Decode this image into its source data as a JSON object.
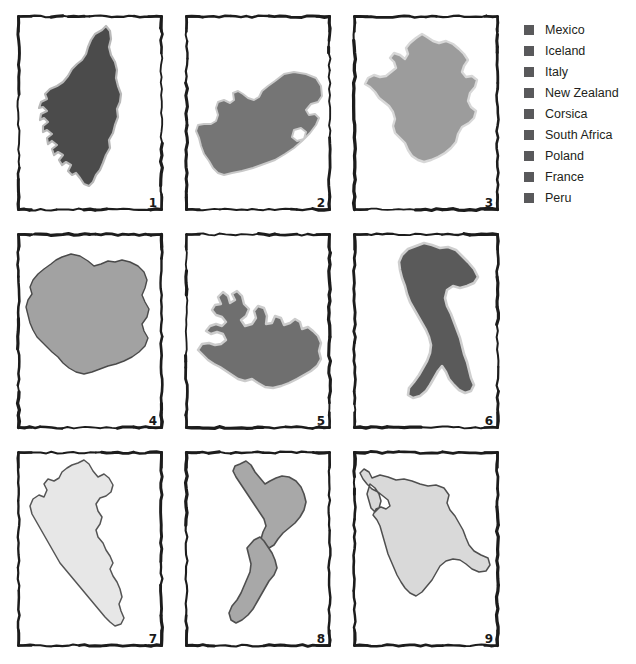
{
  "figure": {
    "type": "country-shape-quiz-grid",
    "background_color": "#ffffff",
    "rows": 3,
    "columns": 3
  },
  "legend": {
    "position": "right",
    "swatch_color": "#59595b",
    "items": [
      {
        "label": "Mexico",
        "swatch": "#59595b"
      },
      {
        "label": "Iceland",
        "swatch": "#59595b"
      },
      {
        "label": "Italy",
        "swatch": "#59595b"
      },
      {
        "label": "New Zealand",
        "swatch": "#59595b"
      },
      {
        "label": "Corsica",
        "swatch": "#59595b"
      },
      {
        "label": "South Africa",
        "swatch": "#59595b"
      },
      {
        "label": "Poland",
        "swatch": "#59595b"
      },
      {
        "label": "France",
        "swatch": "#59595b"
      },
      {
        "label": "Peru",
        "swatch": "#59595b"
      }
    ]
  },
  "panels": [
    {
      "number": "1",
      "shape": "corsica",
      "fill": "#4b4b4b",
      "stroke": "#b9b9b9",
      "stroke_width": 2.2,
      "frame_color": "#1c1c1c"
    },
    {
      "number": "2",
      "shape": "south-africa",
      "fill": "#757575",
      "stroke": "#c9c9c9",
      "stroke_width": 2.0,
      "frame_color": "#1c1c1c"
    },
    {
      "number": "3",
      "shape": "france",
      "fill": "#9c9c9c",
      "stroke": "#d8d8d8",
      "stroke_width": 2.4,
      "frame_color": "#1c1c1c"
    },
    {
      "number": "4",
      "shape": "poland",
      "fill": "#a2a2a2",
      "stroke": "#4a4a4a",
      "stroke_width": 1.4,
      "frame_color": "#1c1c1c"
    },
    {
      "number": "5",
      "shape": "iceland",
      "fill": "#6f6f6f",
      "stroke": "#cccccc",
      "stroke_width": 2.4,
      "frame_color": "#1c1c1c"
    },
    {
      "number": "6",
      "shape": "italy",
      "fill": "#5a5a5a",
      "stroke": "#cfcfcf",
      "stroke_width": 2.6,
      "frame_color": "#1c1c1c"
    },
    {
      "number": "7",
      "shape": "peru",
      "fill": "#e7e7e7",
      "stroke": "#555555",
      "stroke_width": 1.5,
      "frame_color": "#1c1c1c"
    },
    {
      "number": "8",
      "shape": "new-zealand",
      "fill": "#a8a8a8",
      "stroke": "#4f4f4f",
      "stroke_width": 1.6,
      "frame_color": "#1c1c1c"
    },
    {
      "number": "9",
      "shape": "mexico",
      "fill": "#d9d9d9",
      "stroke": "#4f4f4f",
      "stroke_width": 1.5,
      "frame_color": "#1c1c1c"
    }
  ],
  "chart_data": {
    "type": "table",
    "title": "",
    "categories": [
      "1",
      "2",
      "3",
      "4",
      "5",
      "6",
      "7",
      "8",
      "9"
    ],
    "values": [
      "Corsica",
      "South Africa",
      "France",
      "Poland",
      "Iceland",
      "Italy",
      "Peru",
      "New Zealand",
      "Mexico"
    ],
    "legend_entries": [
      "Mexico",
      "Iceland",
      "Italy",
      "New Zealand",
      "Corsica",
      "South Africa",
      "Poland",
      "France",
      "Peru"
    ],
    "legend_position": "right",
    "grid": false
  }
}
